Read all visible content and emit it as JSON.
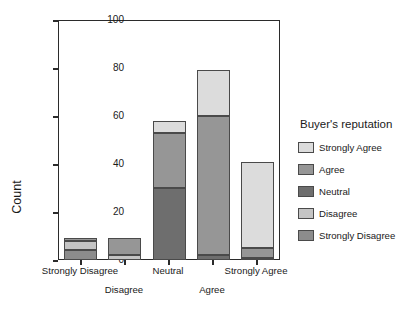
{
  "chart_data": {
    "type": "bar",
    "subtype": "stacked-vertical",
    "title": "",
    "xlabel": "",
    "ylabel": "Count",
    "ylim": [
      0,
      100
    ],
    "yticks": [
      0,
      20,
      40,
      60,
      80,
      100
    ],
    "grid": false,
    "legend_position": "right",
    "legend_title": "Buyer's reputation",
    "categories": [
      "Strongly Disagree",
      "Disagree",
      "Neutral",
      "Agree",
      "Strongly Agree"
    ],
    "series": [
      {
        "name": "Strongly Disagree",
        "color": "#8c8c8c",
        "values": [
          4,
          0,
          0,
          0,
          0
        ]
      },
      {
        "name": "Disagree",
        "color": "#c4c4c4",
        "values": [
          4,
          2,
          0,
          0,
          1
        ]
      },
      {
        "name": "Neutral",
        "color": "#6e6e6e",
        "values": [
          0,
          0,
          30,
          2,
          0
        ]
      },
      {
        "name": "Agree",
        "color": "#969696",
        "values": [
          1,
          7,
          23,
          58,
          4
        ]
      },
      {
        "name": "Strongly Agree",
        "color": "#dcdcdc",
        "values": [
          0,
          0,
          5,
          19,
          36
        ]
      }
    ],
    "totals": [
      9,
      9,
      58,
      79,
      41
    ]
  },
  "axis": {
    "y_tick_labels": [
      "0",
      "20",
      "40",
      "60",
      "80",
      "100"
    ],
    "x_tick_labels": [
      "Strongly Disagree",
      "Disagree",
      "Neutral",
      "Agree",
      "Strongly Agree"
    ],
    "y_axis_title": "Count"
  },
  "legend": {
    "title": "Buyer's reputation",
    "entries": [
      {
        "label": "Strongly Agree",
        "color": "#dcdcdc"
      },
      {
        "label": "Agree",
        "color": "#969696"
      },
      {
        "label": "Neutral",
        "color": "#6e6e6e"
      },
      {
        "label": "Disagree",
        "color": "#c4c4c4"
      },
      {
        "label": "Strongly Disagree",
        "color": "#8c8c8c"
      }
    ]
  }
}
